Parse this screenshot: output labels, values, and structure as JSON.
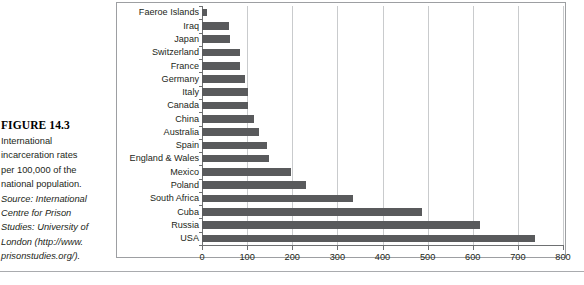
{
  "caption": {
    "figure_number": "FIGURE 14.3",
    "lines": [
      {
        "text": "International",
        "italic": false
      },
      {
        "text": "incarceration rates",
        "italic": false
      },
      {
        "text": "per 100,000 of the",
        "italic": false
      },
      {
        "text": "national population.",
        "italic": false
      },
      {
        "text": "Source: International",
        "italic": true
      },
      {
        "text": "Centre for Prison",
        "italic": true
      },
      {
        "text": "Studies: University of",
        "italic": true
      },
      {
        "text": "London (http://www.",
        "italic": true
      },
      {
        "text": "prisonstudies.org/).",
        "italic": true
      }
    ]
  },
  "colors": {
    "bar": "#595a5c",
    "gridline": "#c9cbcd",
    "axis": "#6e7072",
    "frame": "#9d9fa2",
    "text": "#231f20"
  },
  "chart_data": {
    "type": "bar",
    "orientation": "horizontal",
    "title": "",
    "xlabel": "",
    "ylabel": "",
    "xlim": [
      0,
      800
    ],
    "xticks": [
      0,
      100,
      200,
      300,
      400,
      500,
      600,
      700,
      800
    ],
    "xtick_labels": [
      "0",
      "100",
      "200",
      "300",
      "400",
      "500",
      "600",
      "700",
      "800"
    ],
    "grid": true,
    "grid_axis": "x",
    "legend": false,
    "categories": [
      "Faeroe Islands",
      "Iraq",
      "Japan",
      "Switzerland",
      "France",
      "Germany",
      "Italy",
      "Canada",
      "China",
      "Australia",
      "Spain",
      "England & Wales",
      "Mexico",
      "Poland",
      "South Africa",
      "Cuba",
      "Russia",
      "USA"
    ],
    "values": [
      12,
      60,
      62,
      85,
      85,
      95,
      102,
      102,
      115,
      126,
      145,
      148,
      198,
      230,
      335,
      487,
      617,
      738
    ]
  }
}
